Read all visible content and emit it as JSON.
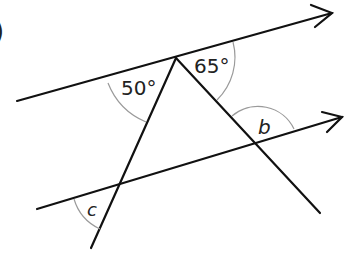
{
  "diagram": {
    "type": "parallel-lines-angles",
    "question_marker": ")",
    "labels": {
      "angle_50": "50°",
      "angle_65": "65°",
      "angle_b": "b",
      "angle_c": "c"
    },
    "colors": {
      "lines": "#111111",
      "arcs": "#9a9a9a",
      "text": "#222222"
    }
  }
}
